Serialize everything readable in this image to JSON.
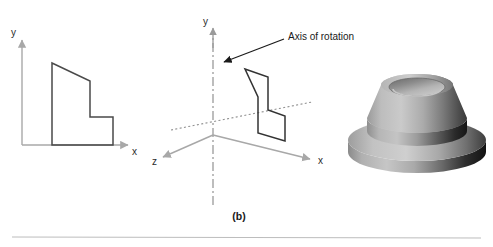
{
  "figure": {
    "caption": "(b)",
    "panels": {
      "profile_2d": {
        "axis_x_label": "x",
        "axis_y_label": "y"
      },
      "rotation_setup": {
        "axis_x_label": "x",
        "axis_y_label": "y",
        "axis_z_label": "z",
        "annotation": "Axis of rotation"
      },
      "solid_of_revolution": {
        "description": "revolved solid"
      }
    }
  },
  "colors": {
    "axis_gray": "#a8a8a8",
    "profile_stroke": "#4a4a4a",
    "rotation_axis": "#9a9a9a",
    "ground_dotted": "#8f8f8f",
    "annotation_arrow": "#1a1a1a",
    "text_dark": "#1a1a1a",
    "rule_gray": "#bdbdbd",
    "solid_light": "#c9c9c9",
    "solid_mid": "#8f8f8f",
    "solid_dark": "#3a3a3a",
    "solid_darkest": "#141414"
  }
}
